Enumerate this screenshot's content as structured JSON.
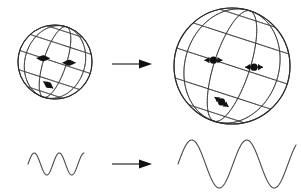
{
  "figure": {
    "background_color": "#ffffff",
    "line_color": "#2b2b2b",
    "grid_color": "#3a3a3a",
    "marker_color": "#111111",
    "wave_color": "#4a4a4a",
    "width": 301,
    "height": 196
  },
  "panels": {
    "top_row_label": "sphere expansion",
    "bottom_row_label": "wavelength stretching"
  },
  "spheres": [
    {
      "id": "sphere-before",
      "role": "small sphere (before expansion)",
      "cx": 55,
      "cy": 62,
      "r": 37,
      "tilt_deg": -18,
      "stroke_width": 1.0,
      "meridian_count": 5,
      "parallel_count": 5,
      "markers": [
        {
          "id": "marker-1",
          "u": -0.32,
          "v": 0.1,
          "arrow_dir": "horizontal-double",
          "arrow_len": 13,
          "dot_r": 3.0
        },
        {
          "id": "marker-2",
          "u": 0.38,
          "v": -0.02,
          "arrow_dir": "horizontal-double",
          "arrow_len": 13,
          "dot_r": 3.0
        },
        {
          "id": "marker-3",
          "u": -0.18,
          "v": -0.62,
          "arrow_dir": "diagonal-double",
          "arrow_len": 12,
          "dot_r": 3.0
        }
      ]
    },
    {
      "id": "sphere-after",
      "role": "large sphere (after expansion)",
      "cx": 232,
      "cy": 66,
      "r": 58,
      "tilt_deg": -18,
      "stroke_width": 1.0,
      "meridian_count": 5,
      "parallel_count": 5,
      "markers": [
        {
          "id": "marker-1",
          "u": -0.32,
          "v": 0.1,
          "arrow_dir": "horizontal-double",
          "arrow_len": 18,
          "dot_r": 3.6
        },
        {
          "id": "marker-2",
          "u": 0.38,
          "v": -0.02,
          "arrow_dir": "horizontal-double",
          "arrow_len": 18,
          "dot_r": 3.6
        },
        {
          "id": "marker-3",
          "u": -0.18,
          "v": -0.62,
          "arrow_dir": "diagonal-double",
          "arrow_len": 17,
          "dot_r": 3.6
        }
      ]
    }
  ],
  "transition_arrows": [
    {
      "id": "arrow-top",
      "x1": 112,
      "y1": 64,
      "x2": 152,
      "y2": 64,
      "head_length": 13,
      "head_width": 9
    },
    {
      "id": "arrow-bottom",
      "x1": 112,
      "y1": 164,
      "x2": 152,
      "y2": 164,
      "head_length": 13,
      "head_width": 9
    }
  ],
  "chart_data": {
    "type": "line",
    "xlabel": "",
    "ylabel": "",
    "grid": false,
    "legend_position": "none",
    "series": [
      {
        "name": "wave-before",
        "role": "short wavelength (before expansion)",
        "x_start": 28,
        "x_end": 84,
        "baseline_y": 164,
        "amplitude": 11,
        "wavelength": 25,
        "cycles": 2.2,
        "phase_deg": 0,
        "stroke_width": 1.1,
        "samples": 240
      },
      {
        "name": "wave-after",
        "role": "long wavelength (after expansion)",
        "x_start": 178,
        "x_end": 296,
        "baseline_y": 164,
        "amplitude": 24,
        "wavelength": 55,
        "cycles": 2.15,
        "phase_deg": 0,
        "stroke_width": 1.1,
        "samples": 480
      }
    ]
  }
}
